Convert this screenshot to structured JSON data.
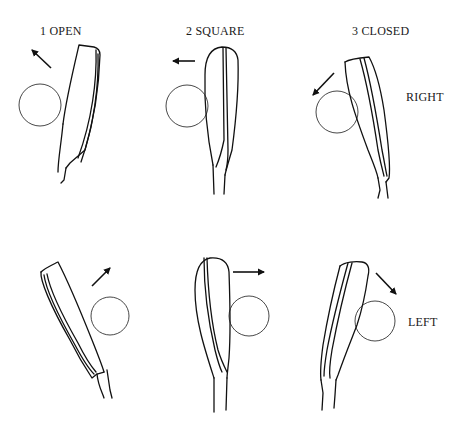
{
  "figure": {
    "type": "golf clubface position diagram",
    "column_labels": [
      "1 OPEN",
      "2 SQUARE",
      "3 CLOSED"
    ],
    "row_labels": [
      "RIGHT",
      "LEFT"
    ],
    "panels": [
      {
        "row": "RIGHT",
        "column": "1 OPEN",
        "arrow_direction": "up-left",
        "ball_side": "left"
      },
      {
        "row": "RIGHT",
        "column": "2 SQUARE",
        "arrow_direction": "left",
        "ball_side": "left"
      },
      {
        "row": "RIGHT",
        "column": "3 CLOSED",
        "arrow_direction": "down-left",
        "ball_side": "left"
      },
      {
        "row": "LEFT",
        "column": "1 OPEN",
        "arrow_direction": "up-right",
        "ball_side": "right"
      },
      {
        "row": "LEFT",
        "column": "2 SQUARE",
        "arrow_direction": "right",
        "ball_side": "right"
      },
      {
        "row": "LEFT",
        "column": "3 CLOSED",
        "arrow_direction": "down-right",
        "ball_side": "right"
      }
    ],
    "colors": {
      "ink": "#111111",
      "background": "#ffffff"
    }
  }
}
